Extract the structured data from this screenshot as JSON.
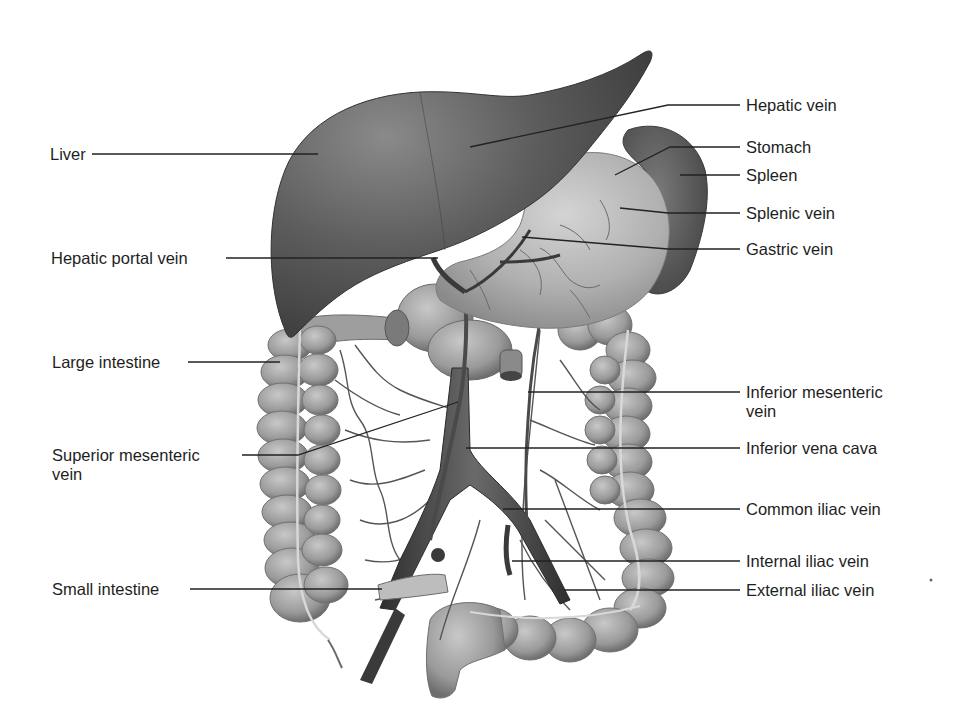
{
  "figure": {
    "colors": {
      "background": "#ffffff",
      "text": "#1e1e1e",
      "leader": "#222222",
      "liver_dark": "#4a4a4a",
      "liver_mid": "#6b6b6b",
      "stomach": "#b8b8b8",
      "intestine": "#9a9a9a",
      "vein": "#3c3c3c"
    }
  },
  "labels_left": [
    {
      "id": "liver",
      "text": "Liver"
    },
    {
      "id": "hepatic-portal-vein",
      "text": "Hepatic portal vein"
    },
    {
      "id": "large-intestine",
      "text": "Large intestine"
    },
    {
      "id": "superior-mesenteric-vein",
      "line1": "Superior mesenteric",
      "line2": "vein"
    },
    {
      "id": "small-intestine",
      "text": "Small intestine"
    }
  ],
  "labels_right": [
    {
      "id": "hepatic-vein",
      "text": "Hepatic vein"
    },
    {
      "id": "stomach",
      "text": "Stomach"
    },
    {
      "id": "spleen",
      "text": "Spleen"
    },
    {
      "id": "splenic-vein",
      "text": "Splenic vein"
    },
    {
      "id": "gastric-vein",
      "text": "Gastric vein"
    },
    {
      "id": "inferior-mesenteric-vein",
      "line1": "Inferior mesenteric",
      "line2": "vein"
    },
    {
      "id": "inferior-vena-cava",
      "text": "Inferior vena cava"
    },
    {
      "id": "common-iliac-vein",
      "text": "Common iliac vein"
    },
    {
      "id": "internal-iliac-vein",
      "text": "Internal iliac vein"
    },
    {
      "id": "external-iliac-vein",
      "text": "External iliac vein"
    }
  ]
}
